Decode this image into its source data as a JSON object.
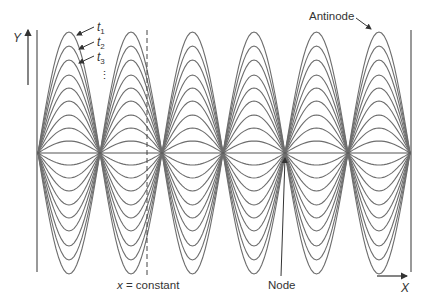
{
  "axes": {
    "y_label": "Y",
    "x_label": "X"
  },
  "labels": {
    "antinode": "Antinode",
    "node": "Node",
    "x_constant": "x = constant",
    "time_labels": [
      {
        "name": "t",
        "sub": "1"
      },
      {
        "name": "t",
        "sub": "2"
      },
      {
        "name": "t",
        "sub": "3"
      }
    ],
    "ellipsis": "⋮"
  },
  "geometry": {
    "axis_y": 153,
    "nodes_x": [
      38,
      100,
      162,
      223,
      285,
      348,
      410
    ],
    "amplitudes": [
      121,
      107,
      93,
      78,
      65,
      52,
      38,
      25,
      12,
      -12,
      -25,
      -38,
      -52,
      -65,
      -78,
      -93,
      -107,
      -121
    ],
    "dashed_x": 147,
    "wall_top": 30,
    "wall_bottom": 272
  },
  "colors": {
    "curve": "#6e6e6e",
    "axis": "#555555",
    "text": "#333333"
  }
}
